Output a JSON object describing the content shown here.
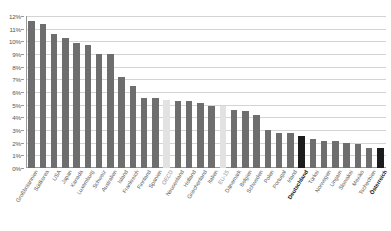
{
  "chart_data": {
    "type": "bar",
    "title": "",
    "subtitle": "",
    "xlabel": "",
    "ylabel": "",
    "ylim": [
      0,
      12
    ],
    "grid": true,
    "legend": false,
    "y_tick_labels": [
      "0%",
      "1%",
      "2%",
      "3%",
      "4%",
      "5%",
      "6%",
      "7%",
      "8%",
      "9%",
      "10%",
      "11%",
      "12%"
    ],
    "y_tick_values": [
      0,
      1,
      2,
      3,
      4,
      5,
      6,
      7,
      8,
      9,
      10,
      11,
      12
    ],
    "categories": [
      "Großbritannien",
      "Südkorea",
      "USA",
      "Japan",
      "Kanada",
      "Luxemburg",
      "Schweiz",
      "Australien",
      "Island",
      "Frankreich",
      "Finnland",
      "Spanien",
      "OECD",
      "Neuseeland",
      "Holland",
      "Griechenland",
      "Italien",
      "EU-15",
      "Dänemark",
      "Belgien",
      "Schweden",
      "Polen",
      "Portugal",
      "Irland",
      "Deutschland",
      "Türkei",
      "Norwegen",
      "Ungarn",
      "Slowakei",
      "Mexiko",
      "Tschechien",
      "Österreich"
    ],
    "values": [
      11.6,
      11.4,
      10.6,
      10.3,
      9.9,
      9.7,
      9.0,
      9.0,
      7.2,
      6.5,
      5.5,
      5.5,
      5.4,
      5.3,
      5.3,
      5.1,
      4.9,
      4.9,
      4.6,
      4.5,
      4.2,
      3.0,
      2.8,
      2.8,
      2.5,
      2.3,
      2.1,
      2.1,
      2.0,
      1.9,
      1.6,
      1.6
    ],
    "bar_styles": [
      "normal",
      "normal",
      "normal",
      "normal",
      "normal",
      "normal",
      "normal",
      "normal",
      "normal",
      "normal",
      "normal",
      "normal",
      "average",
      "normal",
      "normal",
      "normal",
      "normal",
      "average",
      "normal",
      "normal",
      "normal",
      "normal",
      "normal",
      "normal",
      "highlight",
      "normal",
      "normal",
      "normal",
      "normal",
      "normal",
      "normal",
      "highlight"
    ],
    "colors": {
      "bar_default": "#6e6e6e",
      "bar_average": "#e2e2e2",
      "bar_highlight": "#1c1c1c",
      "gridline": "#d4d4d4",
      "axis": "#9a9a9a",
      "text": "#5a5a5a",
      "background": "#ffffff"
    }
  }
}
